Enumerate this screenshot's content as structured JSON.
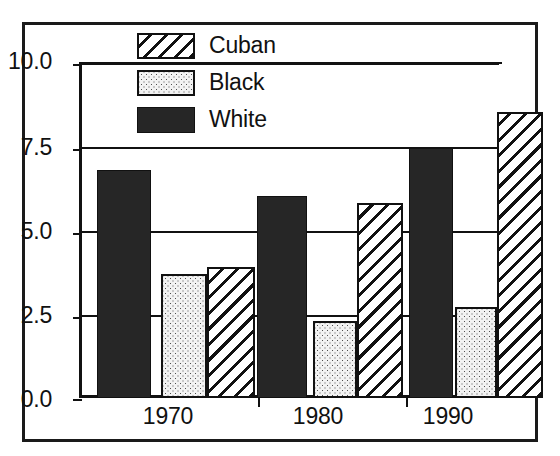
{
  "chart_data": {
    "type": "bar",
    "title": "",
    "subtitle": "",
    "xlabel": "",
    "ylabel": "",
    "categories": [
      "1970",
      "1980",
      "1990"
    ],
    "series": [
      {
        "name": "White",
        "pattern": "solid-black",
        "values": [
          6.8,
          6.0,
          7.45
        ]
      },
      {
        "name": "Black",
        "pattern": "stippled-dots",
        "values": [
          3.7,
          2.3,
          2.7
        ]
      },
      {
        "name": "Cuban",
        "pattern": "diagonal-hatch",
        "values": [
          3.9,
          5.8,
          8.5
        ]
      }
    ],
    "ylim": [
      0.0,
      10.0
    ],
    "yticks": [
      "0.0",
      "2.5",
      "5.0",
      "7.5",
      "10.0"
    ],
    "ytick_values": [
      0.0,
      2.5,
      5.0,
      7.5,
      10.0
    ],
    "grid": true,
    "grid_axis": "y",
    "legend_position": "top-center",
    "legend_order": [
      "Cuban",
      "Black",
      "White"
    ],
    "colors": {
      "ink": "#111111",
      "white_series": "#262626",
      "black_series": "#f2f2f2",
      "cuban_series": "#ffffff",
      "background": "#ffffff"
    }
  },
  "legend": {
    "items": [
      {
        "label": "Cuban"
      },
      {
        "label": "Black"
      },
      {
        "label": "White"
      }
    ]
  },
  "axis": {
    "y_labels": [
      "10.0",
      "7.5",
      "5.0",
      "2.5",
      "0.0"
    ],
    "x_labels": [
      "1970",
      "1980",
      "1990"
    ]
  }
}
